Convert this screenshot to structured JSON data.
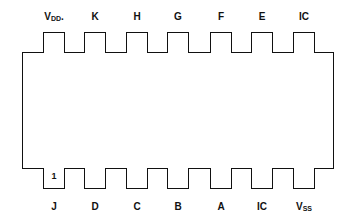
{
  "diagram": {
    "title": "",
    "type": "IC pinout (14-pin DIP)",
    "top_pins": [
      {
        "label": "V",
        "sub": "DD",
        "suffix": "."
      },
      {
        "label": "K",
        "sub": "",
        "suffix": ""
      },
      {
        "label": "H",
        "sub": "",
        "suffix": ""
      },
      {
        "label": "G",
        "sub": "",
        "suffix": ""
      },
      {
        "label": "F",
        "sub": "",
        "suffix": ""
      },
      {
        "label": "E",
        "sub": "",
        "suffix": ""
      },
      {
        "label": "IC",
        "sub": "",
        "suffix": ""
      }
    ],
    "bottom_pins": [
      {
        "label": "J",
        "sub": "",
        "number": "1"
      },
      {
        "label": "D",
        "sub": "",
        "number": ""
      },
      {
        "label": "C",
        "sub": "",
        "number": ""
      },
      {
        "label": "B",
        "sub": "",
        "number": ""
      },
      {
        "label": "A",
        "sub": "",
        "number": ""
      },
      {
        "label": "IC",
        "sub": "",
        "number": ""
      },
      {
        "label": "V",
        "sub": "SS",
        "number": ""
      }
    ],
    "colors": {
      "stroke": "#111111",
      "background": "#ffffff"
    }
  }
}
